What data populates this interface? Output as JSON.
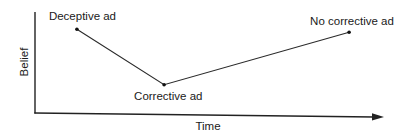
{
  "diagram": {
    "title": "",
    "x_axis_label": "Time",
    "y_axis_label": "Belief",
    "line_color": "#222222",
    "background": "#ffffff"
  },
  "chart_data": {
    "type": "line",
    "title": "",
    "xlabel": "Time",
    "ylabel": "Belief",
    "grid": false,
    "legend": "none",
    "axis_ticks": "none",
    "xlim": [
      0,
      1
    ],
    "ylim": [
      0,
      1
    ],
    "series": [
      {
        "name": "Belief over time",
        "points": [
          {
            "label": "Deceptive ad",
            "x": 0.12,
            "y": 0.83
          },
          {
            "label": "Corrective ad",
            "x": 0.37,
            "y": 0.28
          },
          {
            "label": "No corrective ad",
            "x": 0.9,
            "y": 0.8
          }
        ]
      }
    ]
  }
}
